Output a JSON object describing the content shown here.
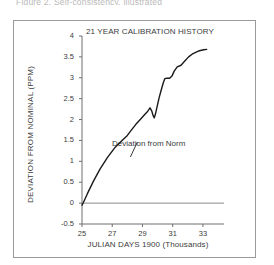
{
  "figure": {
    "caption": "Figure 2. Self-consistency, illustrated"
  },
  "chart_data": {
    "type": "line",
    "title": "21 YEAR CALIBRATION HISTORY",
    "xlabel": "JULIAN DAYS 1900  (Thousands)",
    "ylabel": "DEVIATION FROM NOMINAL (PPM)",
    "xlim": [
      25,
      33.6
    ],
    "ylim": [
      -0.5,
      4
    ],
    "xticks": [
      25,
      27,
      29,
      31,
      33
    ],
    "xtick_labels": [
      "25",
      "27",
      "29",
      "31",
      "33"
    ],
    "yticks": [
      -0.5,
      0,
      0.5,
      1,
      1.5,
      2,
      2.5,
      3,
      3.5,
      4
    ],
    "ytick_labels": [
      "-0.5",
      "0",
      "0.5",
      "1",
      "1.5",
      "2",
      "2.5",
      "3",
      "3.5",
      "4"
    ],
    "grid": false,
    "legend": "none",
    "annotations": [
      {
        "text": "Deviation from Norm",
        "x": 28.6,
        "y": 1.32
      }
    ],
    "reference_lines": [
      {
        "name": "zero-line",
        "axis": "y",
        "value": 0,
        "color": "#8c8c8c"
      }
    ],
    "series": [
      {
        "name": "Deviation from Norm",
        "color": "#1a1a1a",
        "x": [
          25.0,
          25.1,
          25.35,
          25.75,
          26.2,
          26.7,
          27.2,
          27.65,
          28.0,
          28.25,
          28.55,
          28.9,
          29.15,
          29.35,
          29.5,
          29.62,
          29.7,
          29.78,
          29.85,
          29.95,
          30.1,
          30.25,
          30.38,
          30.48,
          30.6,
          30.8,
          30.95,
          31.1,
          31.3,
          31.55,
          31.8,
          32.05,
          32.35,
          32.7,
          33.05,
          33.25
        ],
        "y": [
          -0.05,
          0.02,
          0.22,
          0.52,
          0.82,
          1.1,
          1.34,
          1.5,
          1.62,
          1.74,
          1.88,
          2.02,
          2.12,
          2.2,
          2.28,
          2.2,
          2.1,
          2.04,
          2.12,
          2.28,
          2.52,
          2.72,
          2.88,
          2.98,
          2.99,
          2.99,
          3.04,
          3.16,
          3.26,
          3.3,
          3.4,
          3.5,
          3.58,
          3.64,
          3.67,
          3.68
        ]
      }
    ]
  }
}
